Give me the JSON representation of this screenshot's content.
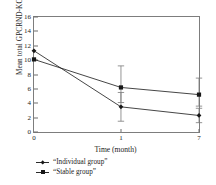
{
  "chart_data": {
    "type": "line",
    "title": "",
    "xlabel": "Time (month)",
    "ylabel": "Mean total GPCRND-KOA",
    "x": [
      0,
      1,
      7
    ],
    "xtick_labels": [
      "0",
      "1",
      "7"
    ],
    "ytick_labels": [
      "0",
      "2",
      "4",
      "6",
      "8",
      "10",
      "12",
      "14",
      "16"
    ],
    "yticks": [
      0,
      2,
      4,
      6,
      8,
      10,
      12,
      14,
      16
    ],
    "ylim": [
      0,
      16
    ],
    "xlim": [
      0,
      7
    ],
    "grid": false,
    "legend_position": "below-axes-left",
    "series": [
      {
        "name": "“Individual group”",
        "marker": "diamond",
        "color": "#171717",
        "values": [
          11.3,
          3.5,
          2.3
        ],
        "error_low": [
          11.3,
          1.5,
          1.3
        ],
        "error_high": [
          11.3,
          5.5,
          3.3
        ]
      },
      {
        "name": "“Stable group”",
        "marker": "square",
        "color": "#171717",
        "values": [
          10.1,
          6.2,
          5.2
        ],
        "error_low": [
          10.1,
          4.1,
          3.6
        ],
        "error_high": [
          10.1,
          9.2,
          7.5
        ]
      }
    ]
  },
  "legend": {
    "items": [
      {
        "label": "“Individual group”",
        "marker": "diamond"
      },
      {
        "label": "“Stable group”",
        "marker": "square"
      }
    ]
  },
  "axes": {
    "frame_color": "#7d7d7d",
    "tick_color": "#6f6f6f"
  }
}
